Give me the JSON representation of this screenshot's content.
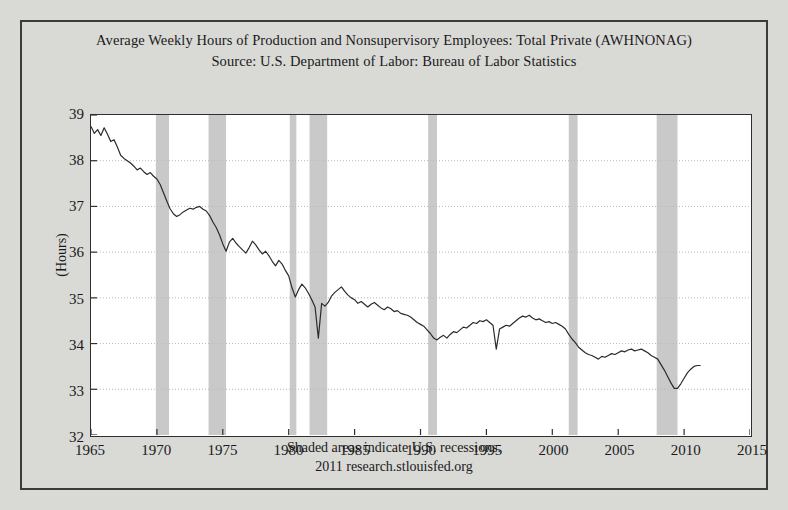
{
  "figure": {
    "background_color": "#d9d9d6",
    "plot_background_color": "#ffffff",
    "frame_color": "#3b3b3b"
  },
  "title": {
    "line1": "Average Weekly Hours of Production and Nonsupervisory Employees: Total Private (AWHNONAG)",
    "line2": "Source: U.S. Department of Labor: Bureau of Labor Statistics"
  },
  "footer": {
    "line1": "Shaded areas indicate U.S. recessions.",
    "line2": "2011 research.stlouisfed.org"
  },
  "chart_data": {
    "type": "line",
    "title": "Average Weekly Hours of Production and Nonsupervisory Employees: Total Private (AWHNONAG)",
    "subtitle": "Source: U.S. Department of Labor: Bureau of Labor Statistics",
    "xlabel": "",
    "ylabel": "(Hours)",
    "xlim": [
      1965,
      2015
    ],
    "ylim": [
      32,
      39
    ],
    "xticks": [
      1965,
      1970,
      1975,
      1980,
      1985,
      1990,
      1995,
      2000,
      2005,
      2010,
      2015
    ],
    "yticks": [
      32,
      33,
      34,
      35,
      36,
      37,
      38,
      39
    ],
    "grid": true,
    "grid_style": "dotted",
    "grid_color": "#b8b8b8",
    "legend": "none",
    "line_color": "#2b2b2b",
    "line_width": 1.2,
    "shading_color": "#c9c9c9",
    "shading_note": "Shaded areas indicate U.S. recessions.",
    "recessions": [
      {
        "start": 1969.92,
        "end": 1970.92
      },
      {
        "start": 1973.92,
        "end": 1975.25
      },
      {
        "start": 1980.08,
        "end": 1980.58
      },
      {
        "start": 1981.58,
        "end": 1982.92
      },
      {
        "start": 1990.58,
        "end": 1991.25
      },
      {
        "start": 2001.25,
        "end": 2001.92
      },
      {
        "start": 2007.92,
        "end": 2009.5
      }
    ],
    "series": [
      {
        "name": "AWHNONAG",
        "units": "Hours",
        "x": [
          1965.0,
          1965.25,
          1965.5,
          1965.75,
          1966.0,
          1966.25,
          1966.5,
          1966.75,
          1967.0,
          1967.25,
          1967.5,
          1967.75,
          1968.0,
          1968.25,
          1968.5,
          1968.75,
          1969.0,
          1969.25,
          1969.5,
          1969.75,
          1970.0,
          1970.25,
          1970.5,
          1970.75,
          1971.0,
          1971.25,
          1971.5,
          1971.75,
          1972.0,
          1972.25,
          1972.5,
          1972.75,
          1973.0,
          1973.25,
          1973.5,
          1973.75,
          1974.0,
          1974.25,
          1974.5,
          1974.75,
          1975.0,
          1975.25,
          1975.5,
          1975.75,
          1976.0,
          1976.25,
          1976.5,
          1976.75,
          1977.0,
          1977.25,
          1977.5,
          1977.75,
          1978.0,
          1978.25,
          1978.5,
          1978.75,
          1979.0,
          1979.25,
          1979.5,
          1979.75,
          1980.0,
          1980.25,
          1980.5,
          1980.75,
          1981.0,
          1981.25,
          1981.5,
          1981.75,
          1982.0,
          1982.25,
          1982.5,
          1982.75,
          1983.0,
          1983.25,
          1983.5,
          1983.75,
          1984.0,
          1984.25,
          1984.5,
          1984.75,
          1985.0,
          1985.25,
          1985.5,
          1985.75,
          1986.0,
          1986.25,
          1986.5,
          1986.75,
          1987.0,
          1987.25,
          1987.5,
          1987.75,
          1988.0,
          1988.25,
          1988.5,
          1988.75,
          1989.0,
          1989.25,
          1989.5,
          1989.75,
          1990.0,
          1990.25,
          1990.5,
          1990.75,
          1991.0,
          1991.25,
          1991.5,
          1991.75,
          1992.0,
          1992.25,
          1992.5,
          1992.75,
          1993.0,
          1993.25,
          1993.5,
          1993.75,
          1994.0,
          1994.25,
          1994.5,
          1994.75,
          1995.0,
          1995.25,
          1995.5,
          1995.75,
          1996.0,
          1996.25,
          1996.5,
          1996.75,
          1997.0,
          1997.25,
          1997.5,
          1997.75,
          1998.0,
          1998.25,
          1998.5,
          1998.75,
          1999.0,
          1999.25,
          1999.5,
          1999.75,
          2000.0,
          2000.25,
          2000.5,
          2000.75,
          2001.0,
          2001.25,
          2001.5,
          2001.75,
          2002.0,
          2002.25,
          2002.5,
          2002.75,
          2003.0,
          2003.25,
          2003.5,
          2003.75,
          2004.0,
          2004.25,
          2004.5,
          2004.75,
          2005.0,
          2005.25,
          2005.5,
          2005.75,
          2006.0,
          2006.25,
          2006.5,
          2006.75,
          2007.0,
          2007.25,
          2007.5,
          2007.75,
          2008.0,
          2008.25,
          2008.5,
          2008.75,
          2009.0,
          2009.25,
          2009.5,
          2009.75,
          2010.0,
          2010.25,
          2010.5,
          2010.75,
          2011.0,
          2011.25
        ],
        "y": [
          38.75,
          38.6,
          38.68,
          38.55,
          38.72,
          38.58,
          38.42,
          38.46,
          38.3,
          38.12,
          38.05,
          38.0,
          37.95,
          37.88,
          37.8,
          37.84,
          37.76,
          37.7,
          37.74,
          37.66,
          37.6,
          37.48,
          37.3,
          37.12,
          36.95,
          36.84,
          36.78,
          36.82,
          36.88,
          36.92,
          36.96,
          36.94,
          36.98,
          37.0,
          36.94,
          36.9,
          36.8,
          36.66,
          36.54,
          36.38,
          36.18,
          36.02,
          36.22,
          36.3,
          36.2,
          36.12,
          36.05,
          35.98,
          36.1,
          36.24,
          36.16,
          36.05,
          35.96,
          36.02,
          35.92,
          35.8,
          35.7,
          35.82,
          35.74,
          35.6,
          35.48,
          35.22,
          35.02,
          35.18,
          35.3,
          35.22,
          35.1,
          34.96,
          34.8,
          34.12,
          34.88,
          34.82,
          34.9,
          35.04,
          35.12,
          35.18,
          35.24,
          35.14,
          35.06,
          35.0,
          34.96,
          34.88,
          34.92,
          34.86,
          34.8,
          34.86,
          34.9,
          34.84,
          34.78,
          34.74,
          34.8,
          34.76,
          34.7,
          34.72,
          34.66,
          34.64,
          34.62,
          34.58,
          34.52,
          34.46,
          34.42,
          34.38,
          34.3,
          34.22,
          34.12,
          34.08,
          34.14,
          34.18,
          34.12,
          34.2,
          34.26,
          34.24,
          34.3,
          34.36,
          34.34,
          34.4,
          34.46,
          34.44,
          34.5,
          34.48,
          34.52,
          34.46,
          34.4,
          33.88,
          34.32,
          34.36,
          34.4,
          34.38,
          34.44,
          34.5,
          34.56,
          34.6,
          34.58,
          34.62,
          34.56,
          34.52,
          34.54,
          34.5,
          34.46,
          34.48,
          34.44,
          34.46,
          34.42,
          34.38,
          34.32,
          34.2,
          34.1,
          34.02,
          33.92,
          33.86,
          33.8,
          33.76,
          33.74,
          33.7,
          33.66,
          33.72,
          33.7,
          33.74,
          33.78,
          33.76,
          33.8,
          33.84,
          33.82,
          33.86,
          33.88,
          33.84,
          33.86,
          33.88,
          33.84,
          33.8,
          33.74,
          33.7,
          33.66,
          33.54,
          33.42,
          33.28,
          33.14,
          33.02,
          33.02,
          33.12,
          33.24,
          33.36,
          33.44,
          33.5,
          33.52,
          33.52
        ]
      }
    ]
  }
}
